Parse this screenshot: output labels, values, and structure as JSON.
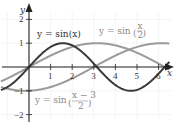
{
  "chart_data": {
    "type": "line",
    "title": "",
    "xlabel": "x",
    "ylabel": "y",
    "xlim": [
      -1.3,
      6.7
    ],
    "ylim": [
      -2.1,
      2.4
    ],
    "x_ticks": [
      "1",
      "2",
      "3",
      "4",
      "5",
      "6"
    ],
    "y_ticks": [
      "2",
      "1",
      "-1",
      "-2"
    ],
    "grid": true,
    "series": [
      {
        "name": "y = sin(x)",
        "label_main": "y = sin(x)",
        "color": "#3a3a3a",
        "function": "sin(x)",
        "x_range": [
          -1.3,
          6.5
        ]
      },
      {
        "name": "y = sin(x/2)",
        "label_main": "y = sin",
        "label_num": "x",
        "label_den": "2",
        "color": "#9a9a9a",
        "function": "sin(x/2)",
        "x_range": [
          -1.3,
          6.5
        ]
      },
      {
        "name": "y = sin((x-3)/2)",
        "label_main": "y = sin",
        "label_num": "x − 3",
        "label_den": "2",
        "color": "#9a9a9a",
        "function": "sin((x-3)/2)",
        "x_range": [
          -1.3,
          6.5
        ]
      }
    ]
  }
}
